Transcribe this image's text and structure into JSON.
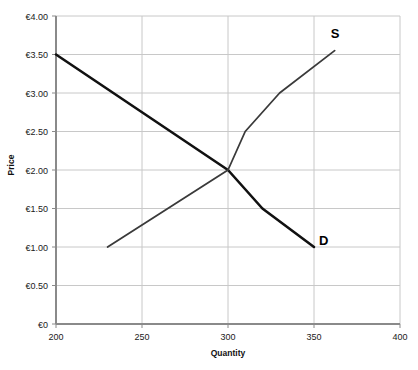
{
  "chart_data": {
    "type": "line",
    "title": "",
    "xlabel": "Quantity",
    "ylabel": "Price",
    "xlim": [
      200,
      400
    ],
    "ylim": [
      0,
      4
    ],
    "grid": true,
    "legend_position": "inline-end-labels",
    "x_ticks": [
      "200",
      "250",
      "300",
      "350",
      "400"
    ],
    "x_tick_values": [
      200,
      250,
      300,
      350,
      400
    ],
    "y_ticks": [
      "€0",
      "€0.50",
      "€1.00",
      "€1.50",
      "€2.00",
      "€2.50",
      "€3.00",
      "€3.50",
      "€4.00"
    ],
    "y_tick_values": [
      0,
      0.5,
      1,
      1.5,
      2,
      2.5,
      3,
      3.5,
      4
    ],
    "currency_symbol": "€",
    "equilibrium": {
      "quantity": 300,
      "price": 2.0
    },
    "series": [
      {
        "name": "D",
        "label": "D",
        "color": "#111111",
        "width": 2.6,
        "points": [
          {
            "x": 200,
            "y": 3.5
          },
          {
            "x": 300,
            "y": 2.0
          },
          {
            "x": 320,
            "y": 1.5
          },
          {
            "x": 350,
            "y": 1.0
          }
        ]
      },
      {
        "name": "S",
        "label": "S",
        "color": "#3a3a3a",
        "width": 1.8,
        "points": [
          {
            "x": 230,
            "y": 1.0
          },
          {
            "x": 300,
            "y": 2.0
          },
          {
            "x": 310,
            "y": 2.5
          },
          {
            "x": 330,
            "y": 3.0
          },
          {
            "x": 362,
            "y": 3.55
          }
        ]
      }
    ],
    "colors": {
      "grid": "#c8c8c8",
      "axis": "#808080",
      "demand": "#111111",
      "supply": "#3a3a3a",
      "background": "#ffffff"
    }
  },
  "labels": {
    "supply_label": "S",
    "demand_label": "D",
    "x_axis_title": "Quantity",
    "y_axis_title": "Price"
  }
}
